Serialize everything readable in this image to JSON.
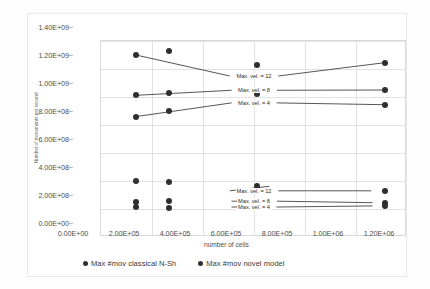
{
  "chart_data": {
    "type": "scatter",
    "title": "",
    "xlabel": "number of cells",
    "ylabel": "Number of movements per second",
    "xlim": [
      0,
      1200000
    ],
    "ylim": [
      0,
      1400000000
    ],
    "grid": true,
    "legend_position": "bottom",
    "xticklabels": [
      "0.00E+00",
      "2.00E+05",
      "4.00E+05",
      "6.00E+05",
      "8.00E+05",
      "1.00E+06",
      "1.20E+06"
    ],
    "xtickvalues": [
      0,
      200000,
      400000,
      600000,
      800000,
      1000000,
      1200000
    ],
    "yticklabels": [
      "0.00E+00",
      "2.00E+08",
      "4.00E+08",
      "6.00E+08",
      "8.00E+08",
      "1.00E+09",
      "1.20E+09",
      "1.40E+09"
    ],
    "ytickvalues": [
      0,
      200000000,
      400000000,
      600000000,
      800000000,
      1000000000,
      1200000000,
      1400000000
    ],
    "series": [
      {
        "name": "Max #mov classical N-Sh",
        "color": "#2f2f2f",
        "points": [
          {
            "x": 137000,
            "y": 398000000
          },
          {
            "x": 137000,
            "y": 248000000
          },
          {
            "x": 137000,
            "y": 212000000
          },
          {
            "x": 268000,
            "y": 396000000
          },
          {
            "x": 268000,
            "y": 256000000
          },
          {
            "x": 268000,
            "y": 208000000
          },
          {
            "x": 612000,
            "y": 362000000
          },
          {
            "x": 612000,
            "y": 253000000
          },
          {
            "x": 612000,
            "y": 215000000
          },
          {
            "x": 1112000,
            "y": 330000000
          },
          {
            "x": 1112000,
            "y": 245000000
          },
          {
            "x": 1112000,
            "y": 222000000
          }
        ]
      },
      {
        "name": "Max #mov novel model",
        "color": "#2f2f2f",
        "points": [
          {
            "x": 137000,
            "y": 1300000000
          },
          {
            "x": 137000,
            "y": 1012000000
          },
          {
            "x": 137000,
            "y": 860000000
          },
          {
            "x": 268000,
            "y": 1330000000
          },
          {
            "x": 268000,
            "y": 1030000000
          },
          {
            "x": 268000,
            "y": 900000000
          },
          {
            "x": 612000,
            "y": 1232000000
          },
          {
            "x": 612000,
            "y": 1045000000
          },
          {
            "x": 612000,
            "y": 1020000000
          },
          {
            "x": 1112000,
            "y": 1245000000
          },
          {
            "x": 1112000,
            "y": 1050000000
          },
          {
            "x": 1112000,
            "y": 945000000
          }
        ]
      }
    ],
    "annotations": [
      {
        "label": "Max. vel. = 12",
        "x": 600000,
        "y": 1150000000,
        "group": "upper"
      },
      {
        "label": "Max. vel. = 8",
        "x": 600000,
        "y": 1048000000,
        "group": "upper"
      },
      {
        "label": "Max. vel. = 4",
        "x": 600000,
        "y": 958000000,
        "group": "upper"
      },
      {
        "label": "Max. vel. = 12",
        "x": 600000,
        "y": 330000000,
        "group": "lower"
      },
      {
        "label": "Max. vel. = 8",
        "x": 600000,
        "y": 256000000,
        "group": "lower"
      },
      {
        "label": "Max. vel. = 4",
        "x": 600000,
        "y": 214000000,
        "group": "lower"
      }
    ],
    "leaders": [
      {
        "x1": 137000,
        "y1": 1300000000,
        "x2": 505000,
        "y2": 1150000000
      },
      {
        "x1": 695000,
        "y1": 1150000000,
        "x2": 1112000,
        "y2": 1245000000
      },
      {
        "x1": 137000,
        "y1": 1012000000,
        "x2": 512000,
        "y2": 1048000000
      },
      {
        "x1": 690000,
        "y1": 1048000000,
        "x2": 1112000,
        "y2": 1050000000
      },
      {
        "x1": 137000,
        "y1": 860000000,
        "x2": 512000,
        "y2": 958000000
      },
      {
        "x1": 688000,
        "y1": 958000000,
        "x2": 1112000,
        "y2": 945000000
      },
      {
        "x1": 660000,
        "y1": 362000000,
        "x2": 505000,
        "y2": 330000000
      },
      {
        "x1": 695000,
        "y1": 330000000,
        "x2": 1060000,
        "y2": 330000000
      },
      {
        "x1": 660000,
        "y1": 253000000,
        "x2": 512000,
        "y2": 256000000
      },
      {
        "x1": 690000,
        "y1": 256000000,
        "x2": 1065000,
        "y2": 245000000
      },
      {
        "x1": 660000,
        "y1": 215000000,
        "x2": 512000,
        "y2": 214000000
      },
      {
        "x1": 688000,
        "y1": 214000000,
        "x2": 1065000,
        "y2": 222000000
      }
    ]
  }
}
